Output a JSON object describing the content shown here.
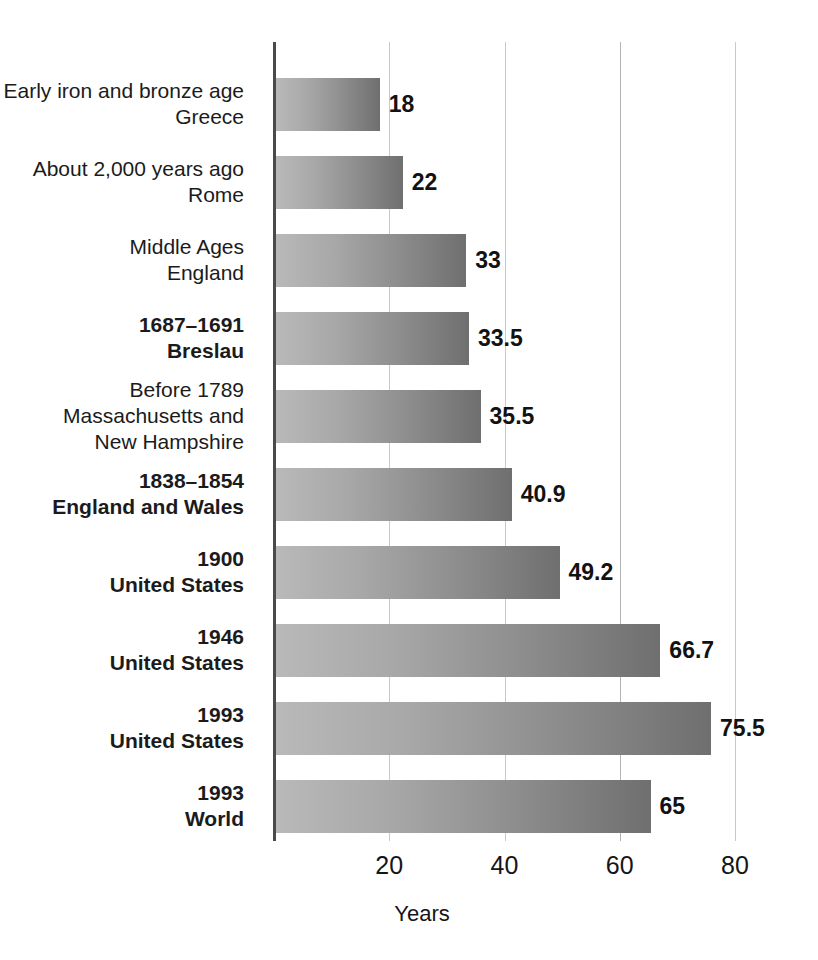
{
  "chart_data": {
    "type": "bar",
    "orientation": "horizontal",
    "title": "",
    "xlabel": "Years",
    "ylabel": "",
    "xlim": [
      0,
      84
    ],
    "xticks": [
      20,
      40,
      60,
      80
    ],
    "xtick_labels": [
      "20",
      "40",
      "60",
      "80"
    ],
    "grid": "vertical",
    "legend": "none",
    "categories": [
      "Early iron and bronze age Greece",
      "About 2,000 years ago Rome",
      "Middle Ages England",
      "1687–1691 Breslau",
      "Before 1789 Massachusetts and New Hampshire",
      "1838–1854 England and Wales",
      "1900 United States",
      "1946 United States",
      "1993 United States",
      "1993 World"
    ],
    "values": [
      18,
      22,
      33,
      33.5,
      35.5,
      40.9,
      49.2,
      66.7,
      75.5,
      65
    ],
    "value_labels": [
      "18",
      "22",
      "33",
      "33.5",
      "35.5",
      "40.9",
      "49.2",
      "66.7",
      "75.5",
      "65"
    ]
  },
  "rows": [
    {
      "label_lines": [
        "Early iron and bronze age",
        "Greece"
      ],
      "bold": false,
      "value": 18,
      "value_label": "18"
    },
    {
      "label_lines": [
        "About 2,000 years ago",
        "Rome"
      ],
      "bold": false,
      "value": 22,
      "value_label": "22"
    },
    {
      "label_lines": [
        "Middle Ages",
        "England"
      ],
      "bold": false,
      "value": 33,
      "value_label": "33"
    },
    {
      "label_lines": [
        "1687–1691",
        "Breslau"
      ],
      "bold": true,
      "value": 33.5,
      "value_label": "33.5"
    },
    {
      "label_lines": [
        "Before 1789",
        "Massachusetts and",
        "New Hampshire"
      ],
      "bold": false,
      "value": 35.5,
      "value_label": "35.5"
    },
    {
      "label_lines": [
        "1838–1854",
        "England and Wales"
      ],
      "bold": true,
      "value": 40.9,
      "value_label": "40.9"
    },
    {
      "label_lines": [
        "1900",
        "United States"
      ],
      "bold": true,
      "value": 49.2,
      "value_label": "49.2"
    },
    {
      "label_lines": [
        "1946",
        "United States"
      ],
      "bold": true,
      "value": 66.7,
      "value_label": "66.7"
    },
    {
      "label_lines": [
        "1993",
        "United States"
      ],
      "bold": true,
      "value": 75.5,
      "value_label": "75.5"
    },
    {
      "label_lines": [
        "1993",
        "World"
      ],
      "bold": true,
      "value": 65,
      "value_label": "65"
    }
  ],
  "axis": {
    "title": "Years",
    "ticks": [
      "20",
      "40",
      "60",
      "80"
    ]
  },
  "colors": {
    "bar_light": "#b9b9b9",
    "bar_dark": "#6f6f6f",
    "axis": "#4a4a4a",
    "gridline": "#c9c9c9",
    "text": "#151515",
    "background": "#ffffff"
  }
}
